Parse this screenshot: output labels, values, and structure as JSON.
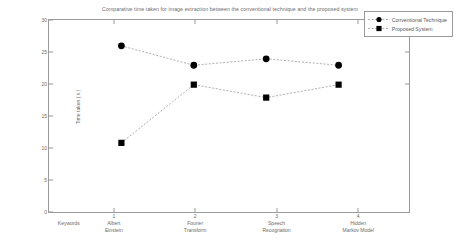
{
  "chart_data": {
    "type": "line",
    "title": "Comparative time taken for image extraction between the conventional technique and the proposed system",
    "xlabel": "",
    "ylabel": "Time taken ( s )",
    "ylim": [
      0,
      30
    ],
    "yticks": [
      0,
      5,
      10,
      15,
      20,
      25,
      30
    ],
    "xlim": [
      0,
      5
    ],
    "xticks": [
      1,
      2,
      3,
      4
    ],
    "xticklabels": [
      "1",
      "2",
      "3",
      "4"
    ],
    "categories": [
      "Keywords",
      "Albert Einstein",
      "Fourier Transform",
      "Speech Recognation",
      "Hidden Markov Model"
    ],
    "grid": false,
    "legend_position": "upper right",
    "series": [
      {
        "name": "Conventional Technique",
        "marker": "circle",
        "x": [
          1,
          2,
          3,
          4
        ],
        "values": [
          26,
          23,
          24,
          23
        ]
      },
      {
        "name": "Proposed System",
        "marker": "square",
        "x": [
          1,
          2,
          3,
          4
        ],
        "values": [
          11,
          20,
          18,
          20
        ]
      }
    ]
  },
  "colors": {
    "series_line": "#999999",
    "marker": "#000000",
    "axis": "#9a9a9a",
    "text": "#6b6b6b",
    "background": "#ffffff"
  }
}
